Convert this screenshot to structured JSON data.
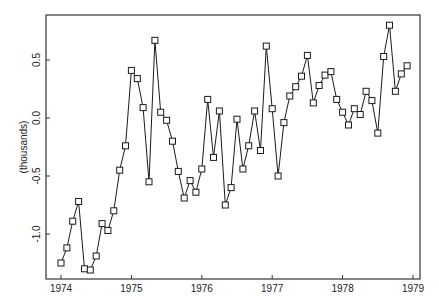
{
  "chart_data": {
    "type": "line",
    "title": "",
    "xlabel": "",
    "ylabel": "(thousands)",
    "marker": "square",
    "grid": false,
    "legend": null,
    "xlim": [
      1973.8,
      1979.1
    ],
    "ylim": [
      -1.4,
      0.89
    ],
    "x_ticks": [
      1974,
      1975,
      1976,
      1977,
      1978,
      1979
    ],
    "x_tick_labels": [
      "1974",
      "1975",
      "1976",
      "1977",
      "1978",
      "1979"
    ],
    "y_ticks": [
      -1.0,
      -0.5,
      0.0,
      0.5
    ],
    "y_tick_labels": [
      "-1.0",
      "-0.5",
      "0.0",
      "0.5"
    ],
    "x_start": 1974.0,
    "x_step": 0.08333,
    "series": [
      {
        "name": "monthly series",
        "values": [
          -1.25,
          -1.12,
          -0.89,
          -0.72,
          -1.3,
          -1.31,
          -1.19,
          -0.91,
          -0.97,
          -0.8,
          -0.45,
          -0.24,
          0.41,
          0.34,
          0.09,
          -0.55,
          0.67,
          0.05,
          -0.02,
          -0.2,
          -0.46,
          -0.69,
          -0.54,
          -0.64,
          -0.44,
          0.16,
          -0.34,
          0.06,
          -0.75,
          -0.6,
          -0.01,
          -0.44,
          -0.24,
          0.06,
          -0.28,
          0.62,
          0.08,
          -0.5,
          -0.04,
          0.19,
          0.27,
          0.36,
          0.54,
          0.13,
          0.28,
          0.37,
          0.4,
          0.16,
          0.05,
          -0.06,
          0.08,
          0.03,
          0.23,
          0.15,
          -0.13,
          0.53,
          0.8,
          0.23,
          0.38,
          0.45
        ]
      }
    ]
  },
  "colors": {
    "line": "#1a1a1a",
    "frame": "#333333",
    "background": "#ffffff"
  }
}
